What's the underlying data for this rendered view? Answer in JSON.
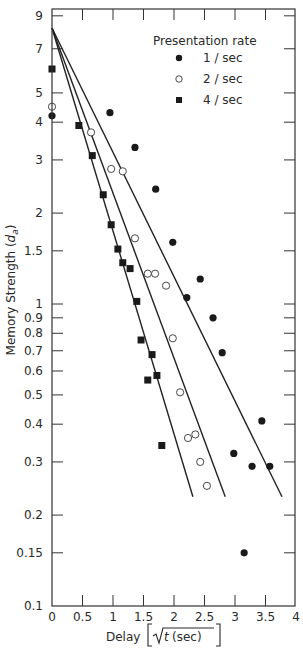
{
  "chart_data": {
    "type": "scatter",
    "title": "",
    "xlabel": "Delay [√t (sec)]",
    "ylabel": "Memory Strength (d_a)",
    "ylabel_parts": {
      "main": "Memory Strength (",
      "d": "d",
      "sub": "a",
      "close": ")"
    },
    "xlabel_parts": {
      "main": "Delay",
      "sqrt_arg": "t",
      "unit": "(sec)"
    },
    "xlim": [
      0,
      4
    ],
    "ylim": [
      0.1,
      9
    ],
    "yscale": "log",
    "grid": false,
    "x_ticks": [
      0,
      0.5,
      1,
      1.5,
      2,
      2.5,
      3,
      3.5,
      4
    ],
    "x_tick_labels": [
      "0",
      "0.5",
      "1",
      "1.5",
      "2",
      "2.5",
      "3",
      "3.5",
      "4"
    ],
    "y_ticks": [
      9,
      7,
      5,
      4,
      3,
      2,
      1.5,
      1,
      0.9,
      0.8,
      0.7,
      0.6,
      0.5,
      0.4,
      0.3,
      0.2,
      0.15,
      0.1
    ],
    "y_tick_labels": [
      "9",
      "7",
      "5",
      "4",
      "3",
      "2",
      "1.5",
      "1",
      "0.9",
      "0.8",
      "0.7",
      "0.6",
      "0.5",
      "0.4",
      "0.3",
      "0.2",
      "0.15",
      "0.1"
    ],
    "legend": {
      "title": "Presentation rate",
      "position": "upper right",
      "entries": [
        {
          "label": "1 / sec",
          "marker": "filled-circle"
        },
        {
          "label": "2 / sec",
          "marker": "open-circle"
        },
        {
          "label": "4 / sec",
          "marker": "filled-square"
        }
      ]
    },
    "series": [
      {
        "name": "1 / sec",
        "marker": "filled-circle",
        "points": [
          [
            0,
            4.2
          ],
          [
            0.95,
            4.3
          ],
          [
            1.36,
            3.3
          ],
          [
            1.7,
            2.4
          ],
          [
            1.98,
            1.6
          ],
          [
            2.21,
            1.05
          ],
          [
            2.43,
            1.21
          ],
          [
            2.64,
            0.9
          ],
          [
            2.79,
            0.69
          ],
          [
            2.98,
            0.32
          ],
          [
            3.15,
            0.15
          ],
          [
            3.28,
            0.29
          ],
          [
            3.44,
            0.41
          ],
          [
            3.57,
            0.29
          ]
        ],
        "fit_line": {
          "x": [
            0,
            3.77
          ],
          "y": [
            8.2,
            0.23
          ]
        }
      },
      {
        "name": "2 / sec",
        "marker": "open-circle",
        "points": [
          [
            0,
            4.5
          ],
          [
            0.64,
            3.7
          ],
          [
            0.97,
            2.8
          ],
          [
            1.16,
            2.75
          ],
          [
            1.36,
            1.65
          ],
          [
            1.57,
            1.26
          ],
          [
            1.69,
            1.26
          ],
          [
            1.87,
            1.15
          ],
          [
            1.98,
            0.77
          ],
          [
            2.1,
            0.51
          ],
          [
            2.23,
            0.36
          ],
          [
            2.35,
            0.37
          ],
          [
            2.43,
            0.3
          ],
          [
            2.54,
            0.25
          ]
        ],
        "fit_line": {
          "x": [
            0,
            2.84
          ],
          "y": [
            8.2,
            0.23
          ]
        }
      },
      {
        "name": "4 / sec",
        "marker": "filled-square",
        "points": [
          [
            0,
            6.0
          ],
          [
            0.44,
            3.9
          ],
          [
            0.66,
            3.1
          ],
          [
            0.84,
            2.3
          ],
          [
            0.97,
            1.83
          ],
          [
            1.08,
            1.52
          ],
          [
            1.16,
            1.37
          ],
          [
            1.28,
            1.31
          ],
          [
            1.39,
            1.02
          ],
          [
            1.46,
            0.76
          ],
          [
            1.57,
            0.56
          ],
          [
            1.64,
            0.68
          ],
          [
            1.72,
            0.58
          ],
          [
            1.8,
            0.34
          ]
        ],
        "fit_line": {
          "x": [
            0,
            2.31
          ],
          "y": [
            8.2,
            0.23
          ]
        }
      }
    ]
  }
}
